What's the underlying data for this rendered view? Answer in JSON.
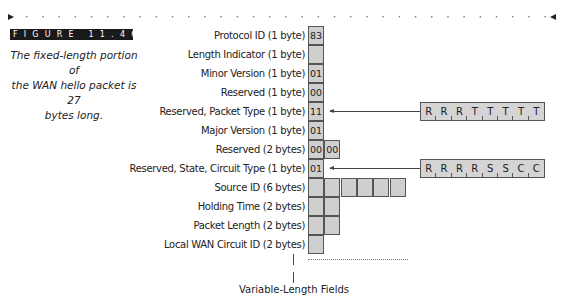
{
  "figure": {
    "label": "FIGURE 11.46",
    "caption_lines": [
      "The fixed-length portion of",
      "the WAN hello packet is 27",
      "bytes long."
    ]
  },
  "fields": [
    {
      "label": "Protocol ID (1 byte)",
      "cells": [
        "83"
      ]
    },
    {
      "label": "Length Indicator (1 byte)",
      "cells": [
        ""
      ]
    },
    {
      "label": "Minor Version (1 byte)",
      "cells": [
        "01"
      ]
    },
    {
      "label": "Reserved (1 byte)",
      "cells": [
        "00"
      ]
    },
    {
      "label": "Reserved, Packet Type (1 byte)",
      "cells": [
        "11"
      ]
    },
    {
      "label": "Major Version (1 byte)",
      "cells": [
        "01"
      ]
    },
    {
      "label": "Reserved (2 bytes)",
      "cells": [
        "00",
        "00"
      ]
    },
    {
      "label": "Reserved, State, Circuit Type (1 byte)",
      "cells": [
        "01"
      ]
    },
    {
      "label": "Source ID (6 bytes)",
      "cells": [
        "",
        "",
        "",
        "",
        "",
        ""
      ]
    },
    {
      "label": "Holding Time (2 bytes)",
      "cells": [
        "",
        ""
      ]
    },
    {
      "label": "Packet Length (2 bytes)",
      "cells": [
        "",
        ""
      ]
    },
    {
      "label": "Local  WAN Circuit ID (2 bytes)",
      "cells": [
        ""
      ]
    }
  ],
  "bit_maps": [
    {
      "row": 4,
      "bits": [
        "R",
        "R",
        "R",
        "T",
        "T",
        "T",
        "T",
        "T"
      ]
    },
    {
      "row": 7,
      "bits": [
        "R",
        "R",
        "R",
        "R",
        "S",
        "S",
        "C",
        "C"
      ]
    }
  ],
  "variable_label": "Variable-Length Fields",
  "colors": {
    "cell_fill": "#cfcfcf",
    "bar": "#1a1a1a"
  }
}
